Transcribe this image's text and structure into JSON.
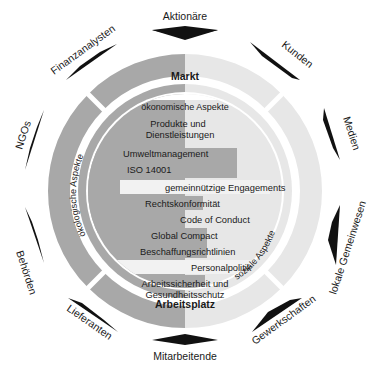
{
  "colors": {
    "dark_gray": "#a8a8a8",
    "light_gray": "#e7e7e7",
    "highlight_bar": "#f2f2f2",
    "arrow": "#111111",
    "background": "#ffffff"
  },
  "sectors": {
    "top": "Markt",
    "bottom": "Arbeitsplatz"
  },
  "aspects": {
    "top": "ökonomische Aspekte",
    "left": "ökologische Aspekte",
    "right": "soziale Aspekte"
  },
  "topics": [
    "Produkte und",
    "Dienstleistungen",
    "Umweltmanagement",
    "ISO 14001",
    "gemeinnützige Engagements",
    "Rechtskonformität",
    "Code of Conduct",
    "Global Compact",
    "Beschaffungsrichtlinien",
    "Personalpolitik",
    "Arbeitssicherheit und",
    "Gesundheitsschutz"
  ],
  "stakeholders": [
    "Aktionäre",
    "Kunden",
    "Medien",
    "lokale Gemeinwesen",
    "Gewerkschaften",
    "Mitarbeitende",
    "Lieferanten",
    "Behörden",
    "NGOs",
    "Finanzanalysten"
  ]
}
